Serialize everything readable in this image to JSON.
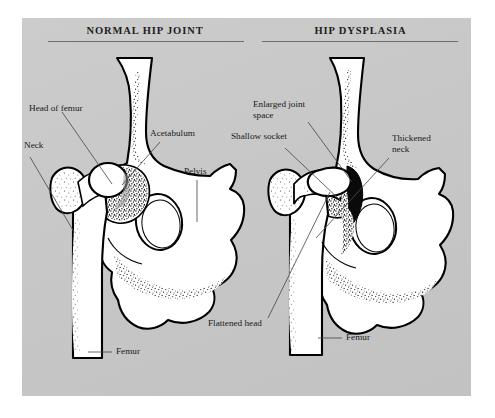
{
  "figure": {
    "background_color": "#c9c9c9",
    "page_color": "#ffffff",
    "ink_color": "#000000",
    "leader_line_color": "#555555"
  },
  "panels": {
    "left": {
      "heading": "NORMAL HIP JOINT",
      "labels": {
        "head_of_femur": "Head of femur",
        "neck": "Neck",
        "acetabulum": "Acetabulum",
        "pelvis": "Pelvis",
        "femur": "Femur"
      }
    },
    "right": {
      "heading": "HIP DYSPLASIA",
      "labels": {
        "enlarged_joint_space": "Enlarged joint\nspace",
        "shallow_socket": "Shallow socket",
        "thickened_neck": "Thickened\nneck",
        "flattened_head": "Flattened head",
        "femur": "Femur"
      }
    }
  }
}
